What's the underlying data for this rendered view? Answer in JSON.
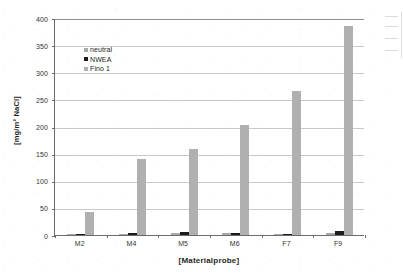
{
  "chart_data": {
    "type": "bar",
    "title": "",
    "subtitle": "",
    "xlabel": "[Materialprobe]",
    "ylabel": "[mg/m² NaCl]",
    "categories": [
      "M2",
      "M4",
      "M5",
      "M6",
      "F7",
      "F9"
    ],
    "series": [
      {
        "name": "neutral",
        "color": "#a9a9a9",
        "values": [
          1.5,
          2.5,
          4.5,
          4.0,
          1.5,
          4.5
        ]
      },
      {
        "name": "NWEA",
        "color": "#1c1c1c",
        "values": [
          1.0,
          3.0,
          5.0,
          4.5,
          2.0,
          7.5
        ]
      },
      {
        "name": "Fino 1",
        "color": "#b0b0b0",
        "values": [
          43,
          141,
          158,
          202,
          265,
          386
        ]
      }
    ],
    "ylim": [
      0,
      400
    ],
    "ytick_step": 50,
    "yticks": [
      0,
      50,
      100,
      150,
      200,
      250,
      300,
      350,
      400
    ],
    "ytick_labels": [
      "0",
      "50",
      "100",
      "150",
      "200",
      "250",
      "300",
      "350",
      "400"
    ],
    "grid": true,
    "grid_axis": "y",
    "legend": true,
    "legend_position": "inside-upper-left",
    "legend_entries": [
      "neutral",
      "NWEA",
      "Fino 1"
    ],
    "annotations": []
  },
  "figure": {
    "background_color": "#ffffff",
    "axis_color": "#6b6b6b",
    "grid_color": "#c9c9c9",
    "text_color": "#2b2b2b"
  }
}
